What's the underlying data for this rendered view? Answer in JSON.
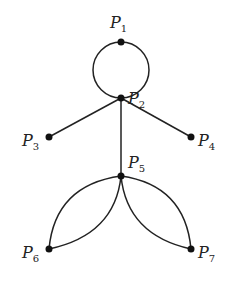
{
  "diagram": {
    "type": "graph",
    "vertices": [
      {
        "id": "P1",
        "label": "P",
        "sub": "1",
        "x": 121,
        "y": 42,
        "lx": 110,
        "ly": 28
      },
      {
        "id": "P2",
        "label": "P",
        "sub": "2",
        "x": 121,
        "y": 98,
        "lx": 128,
        "ly": 104
      },
      {
        "id": "P3",
        "label": "P",
        "sub": "3",
        "x": 49,
        "y": 137,
        "lx": 22,
        "ly": 146
      },
      {
        "id": "P4",
        "label": "P",
        "sub": "4",
        "x": 191,
        "y": 137,
        "lx": 198,
        "ly": 146
      },
      {
        "id": "P5",
        "label": "P",
        "sub": "5",
        "x": 121,
        "y": 176,
        "lx": 128,
        "ly": 168
      },
      {
        "id": "P6",
        "label": "P",
        "sub": "6",
        "x": 49,
        "y": 249,
        "lx": 22,
        "ly": 258
      },
      {
        "id": "P7",
        "label": "P",
        "sub": "7",
        "x": 191,
        "y": 249,
        "lx": 198,
        "ly": 258
      }
    ],
    "edges": [
      {
        "from": "P1",
        "to": "P2",
        "kind": "arc-left"
      },
      {
        "from": "P1",
        "to": "P2",
        "kind": "arc-right"
      },
      {
        "from": "P2",
        "to": "P3",
        "kind": "line"
      },
      {
        "from": "P2",
        "to": "P4",
        "kind": "line"
      },
      {
        "from": "P2",
        "to": "P5",
        "kind": "line"
      },
      {
        "from": "P5",
        "to": "P6",
        "kind": "curve-outer"
      },
      {
        "from": "P5",
        "to": "P6",
        "kind": "curve-inner"
      },
      {
        "from": "P5",
        "to": "P7",
        "kind": "curve-outer"
      },
      {
        "from": "P5",
        "to": "P7",
        "kind": "curve-inner"
      }
    ],
    "colors": {
      "stroke": "#222222",
      "vertex": "#111111",
      "background": "#ffffff"
    }
  }
}
